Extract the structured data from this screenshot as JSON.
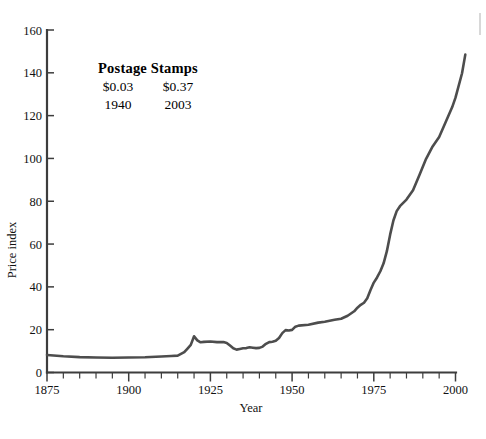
{
  "annotation": {
    "title": "Postage Stamps",
    "values": [
      "$0.03",
      "$0.37"
    ],
    "years": [
      "1940",
      "2003"
    ]
  },
  "chart_data": {
    "type": "line",
    "title": "Postage Stamps",
    "xlabel": "Year",
    "ylabel": "Price index",
    "xlim": [
      1875,
      2000
    ],
    "ylim": [
      0,
      160
    ],
    "grid": false,
    "legend": null,
    "line_color": "#4d4d4d",
    "xticks": [
      1875,
      1900,
      1925,
      1950,
      1975,
      2000
    ],
    "xtick_labels": [
      "1875",
      "1900",
      "1925",
      "1950",
      "1975",
      "2000"
    ],
    "xminor_step": 5,
    "yticks": [
      0,
      20,
      40,
      60,
      80,
      100,
      120,
      140,
      160
    ],
    "ytick_labels": [
      "0",
      "20",
      "40",
      "60",
      "80",
      "100",
      "120",
      "140",
      "160"
    ],
    "series": [
      {
        "name": "Price index",
        "x": [
          1875,
          1880,
          1885,
          1890,
          1895,
          1900,
          1905,
          1910,
          1913,
          1915,
          1917,
          1918,
          1919,
          1920,
          1921,
          1922,
          1923,
          1925,
          1927,
          1929,
          1930,
          1931,
          1932,
          1933,
          1934,
          1935,
          1936,
          1937,
          1938,
          1939,
          1940,
          1941,
          1942,
          1943,
          1944,
          1945,
          1946,
          1947,
          1948,
          1949,
          1950,
          1951,
          1952,
          1955,
          1958,
          1960,
          1963,
          1965,
          1967,
          1969,
          1970,
          1971,
          1972,
          1973,
          1974,
          1975,
          1976,
          1977,
          1978,
          1979,
          1980,
          1981,
          1982,
          1983,
          1985,
          1987,
          1989,
          1991,
          1993,
          1995,
          1997,
          1999,
          2000,
          2002,
          2003
        ],
        "y": [
          8.2,
          7.6,
          7.2,
          7.0,
          6.9,
          7.0,
          7.1,
          7.5,
          7.7,
          7.9,
          9.5,
          11.2,
          12.9,
          16.9,
          15.0,
          14.1,
          14.3,
          14.5,
          14.2,
          14.2,
          13.8,
          12.6,
          11.3,
          10.7,
          11.0,
          11.3,
          11.4,
          11.8,
          11.6,
          11.4,
          11.5,
          12.1,
          13.4,
          14.2,
          14.4,
          14.8,
          16.1,
          18.4,
          19.8,
          19.6,
          19.9,
          21.4,
          21.9,
          22.3,
          23.3,
          23.7,
          24.6,
          25.1,
          26.5,
          28.6,
          30.3,
          31.6,
          32.6,
          34.7,
          38.5,
          42.0,
          44.4,
          47.3,
          51.0,
          56.7,
          64.4,
          71.0,
          75.4,
          77.7,
          80.8,
          85.1,
          92.4,
          99.8,
          105.6,
          110.0,
          117.0,
          124.0,
          128.4,
          139.8,
          148.5
        ]
      }
    ]
  }
}
